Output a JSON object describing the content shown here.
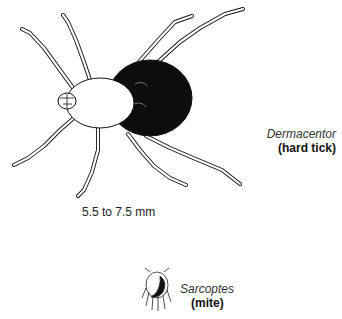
{
  "ticks": {
    "tick": {
      "name": "Dermacentor",
      "kind": "(hard tick)",
      "size": "5.5 to 7.5 mm"
    },
    "mite": {
      "name": "Sarcoptes",
      "kind": "(mite)"
    }
  },
  "colors": {
    "ink": "#111111",
    "background": "#ffffff"
  }
}
